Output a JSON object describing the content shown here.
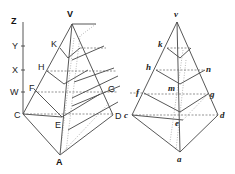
{
  "figure": {
    "left": {
      "labels": {
        "Z": "Z",
        "Y": "Y",
        "X": "X",
        "W": "W",
        "V": "V",
        "K": "K",
        "H": "H",
        "F": "F",
        "C": "C",
        "E": "E",
        "A": "A",
        "D": "D",
        "G": "G"
      }
    },
    "right": {
      "labels": {
        "v": "v",
        "k": "k",
        "h": "h",
        "n": "n",
        "f": "f",
        "m": "m",
        "g": "g",
        "c": "c",
        "e": "e",
        "d": "d",
        "a": "a"
      }
    },
    "colors": {
      "line": "#444444",
      "dashed": "#666666",
      "background": "#ffffff"
    }
  }
}
